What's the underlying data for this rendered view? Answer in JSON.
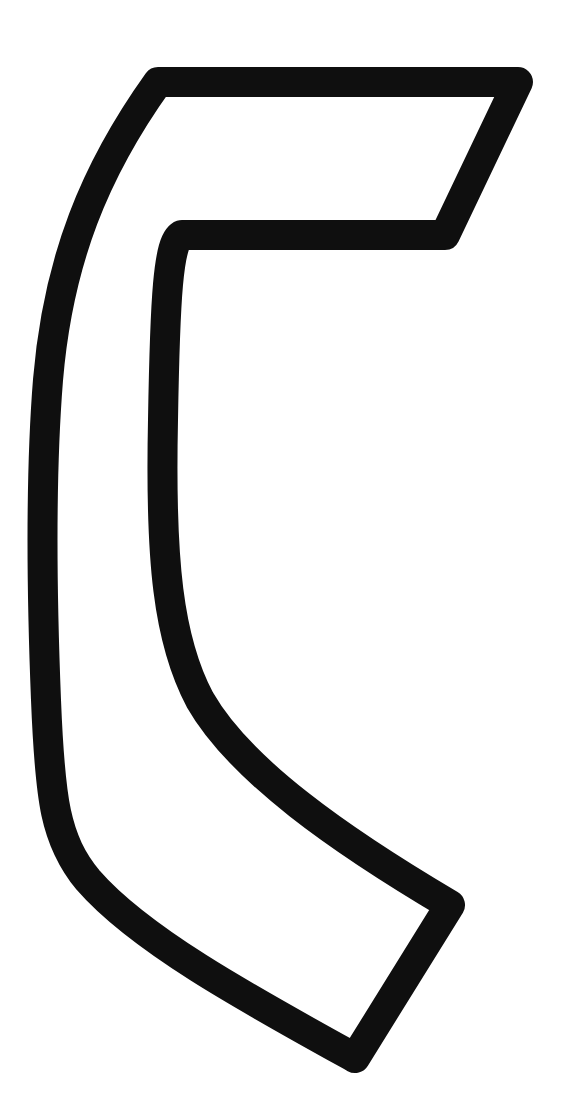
{
  "figure": {
    "background": "#ffffff",
    "stroke_color": "#0f0f0f",
    "fill_color": "#ffffff",
    "stroke_width": 30
  }
}
